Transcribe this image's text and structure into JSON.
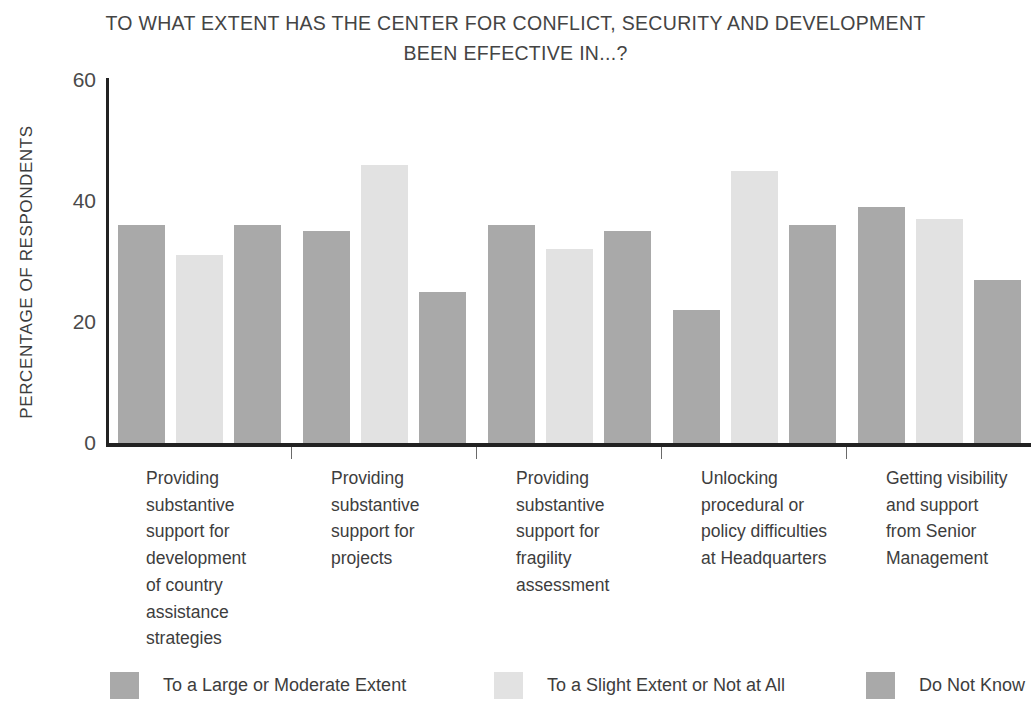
{
  "chart_data": {
    "type": "bar",
    "title": "TO WHAT EXTENT HAS THE CENTER FOR CONFLICT, SECURITY AND DEVELOPMENT\nBEEN EFFECTIVE IN...?",
    "xlabel": "",
    "ylabel": "PERCENTAGE OF RESPONDENTS",
    "ylim": [
      0,
      60
    ],
    "yticks": [
      0,
      20,
      40,
      60
    ],
    "ytick_labels": [
      "0",
      "20",
      "40",
      "60"
    ],
    "grid": false,
    "legend_position": "bottom",
    "categories": [
      "Providing\nsubstantive\nsupport for\ndevelopment\nof country\nassistance\nstrategies",
      "Providing\nsubstantive\nsupport for\nprojects",
      "Providing\nsubstantive\nsupport for\nfragility\nassessment",
      "Unlocking\nprocedural or\npolicy difficulties\nat Headquarters",
      "Getting visibility\nand support\nfrom Senior\nManagement"
    ],
    "series": [
      {
        "name": "To a Large or Moderate Extent",
        "color": "#a9a9a9",
        "values": [
          36,
          35,
          36,
          22,
          39
        ]
      },
      {
        "name": "To a Slight Extent or Not at All",
        "color": "#e2e2e2",
        "values": [
          31,
          46,
          32,
          45,
          37
        ]
      },
      {
        "name": "Do Not Know",
        "color": "#a9a9a9",
        "values": [
          36,
          25,
          35,
          36,
          27
        ]
      }
    ]
  },
  "colors": {
    "dark_gray": "#a9a9a9",
    "light_gray": "#e2e2e2",
    "axis": "#222222",
    "text": "#3d3d3d"
  }
}
